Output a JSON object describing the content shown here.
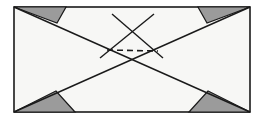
{
  "figure": {
    "type": "geometry-diagram",
    "canvas": {
      "width": 265,
      "height": 119
    },
    "background_color": "#ffffff",
    "frame": {
      "name": "outer-rectangle",
      "x": 14,
      "y": 7,
      "width": 236,
      "height": 105,
      "fill_color": "#f7f7f5",
      "stroke_color": "#1a1a1a",
      "stroke_width": 1.6
    },
    "shaded_color": "#9b9b9b",
    "shaded_stroke_color": "#1a1a1a",
    "line_color": "#1a1a1a",
    "shaded_triangles": [
      {
        "label": "top-left-shaded-triangle",
        "points": "14,7 66,7 57,23"
      },
      {
        "label": "top-right-shaded-triangle",
        "points": "198,7 250,7 207,23"
      },
      {
        "label": "bottom-left-shaded-triangle",
        "points": "14,112 75,112 56,91"
      },
      {
        "label": "bottom-right-shaded-triangle",
        "points": "189,112 250,112 208,91"
      }
    ],
    "solid_lines": [
      {
        "label": "diagonal-top-left-to-bottom-right",
        "x1": 14,
        "y1": 7,
        "x2": 250,
        "y2": 112
      },
      {
        "label": "diagonal-top-right-to-bottom-left",
        "x1": 250,
        "y1": 7,
        "x2": 14,
        "y2": 112
      },
      {
        "label": "peak-left-leg",
        "x1": 112,
        "y1": 14,
        "x2": 163,
        "y2": 58
      },
      {
        "label": "peak-right-leg",
        "x1": 154,
        "y1": 14,
        "x2": 100,
        "y2": 58
      }
    ],
    "dashed_lines": [
      {
        "label": "dashed-connector",
        "x1": 107,
        "y1": 50,
        "x2": 158,
        "y2": 51,
        "dash_pattern": "6,4"
      }
    ],
    "intersections": [
      {
        "label": "left-intersection",
        "x": 106,
        "y": 50
      },
      {
        "label": "right-intersection",
        "x": 158,
        "y": 51
      },
      {
        "label": "apex-intersection",
        "x": 133,
        "y": 32
      }
    ]
  }
}
